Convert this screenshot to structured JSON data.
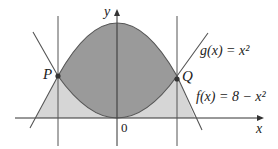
{
  "diagram": {
    "functions": [
      {
        "label": "g(x) = x²",
        "name": "g",
        "expr": "x^2"
      },
      {
        "label": "f(x) = 8 − x²",
        "name": "f",
        "expr": "8 - x^2"
      }
    ],
    "points": [
      {
        "label": "P",
        "x": -2,
        "y": 4
      },
      {
        "label": "Q",
        "x": 2,
        "y": 4
      }
    ],
    "axes": {
      "x_label": "x",
      "y_label": "y",
      "origin_label": "0"
    },
    "colors": {
      "dark_region": "#9a9a9a",
      "light_region": "#d6d6d6",
      "curve": "#555555",
      "axis": "#333333"
    }
  }
}
